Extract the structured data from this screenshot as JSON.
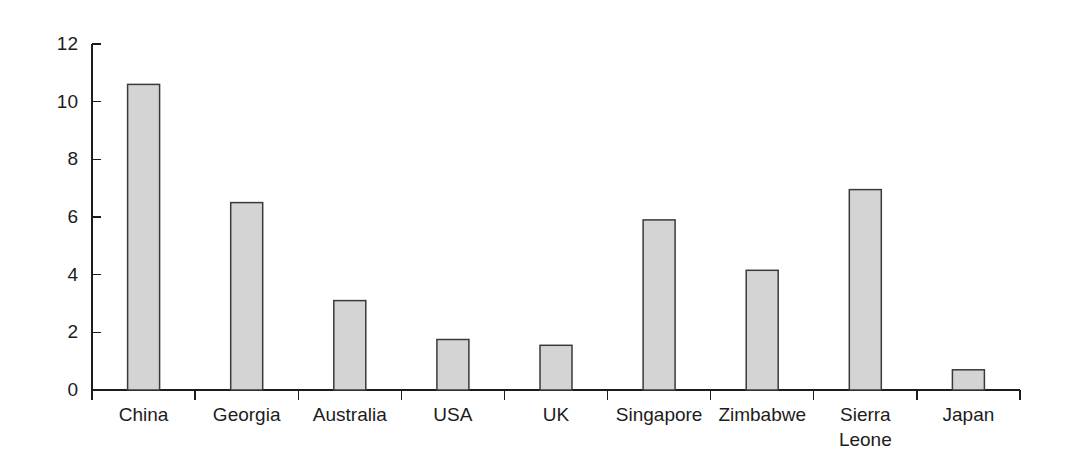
{
  "chart_data": {
    "type": "bar",
    "title": "",
    "subtitle": "",
    "xlabel": "",
    "ylabel": "",
    "categories": [
      "China",
      "Georgia",
      "Australia",
      "USA",
      "UK",
      "Singapore",
      "Zimbabwe",
      "Sierra Leone",
      "Japan"
    ],
    "values": [
      10.6,
      6.5,
      3.1,
      1.75,
      1.55,
      5.9,
      4.15,
      6.95,
      0.7
    ],
    "ylim": [
      0,
      12
    ],
    "ytick_values": [
      0,
      2,
      4,
      6,
      8,
      10,
      12
    ],
    "ytick_labels": [
      "0",
      "2",
      "4",
      "6",
      "8",
      "10",
      "12"
    ],
    "grid": false,
    "legend": null,
    "legend_position": "none",
    "annotations": [],
    "bar_fill_color": "#d4d4d4",
    "bar_edge_color": "#3a3a3a",
    "axis_color": "#1c1c1c",
    "background_color": "#ffffff"
  }
}
